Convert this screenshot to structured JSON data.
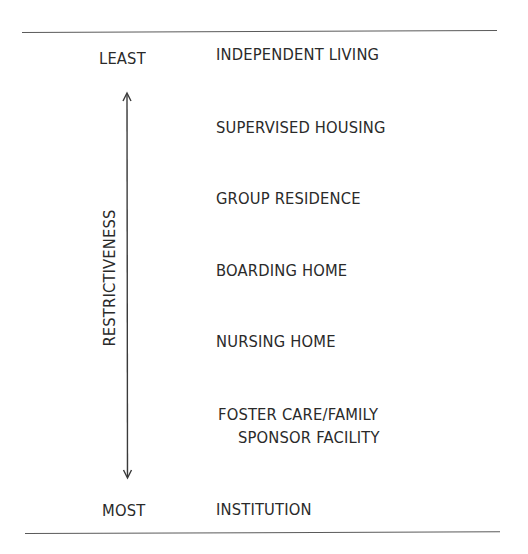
{
  "diagram": {
    "axis": {
      "label": "RESTRICTIVENESS",
      "top_label": "LEAST",
      "bottom_label": "MOST",
      "direction": "bidirectional"
    },
    "levels": [
      {
        "label": "INDEPENDENT LIVING"
      },
      {
        "label": "SUPERVISED HOUSING"
      },
      {
        "label": "GROUP RESIDENCE"
      },
      {
        "label": "BOARDING HOME"
      },
      {
        "label": "NURSING HOME"
      },
      {
        "label_line1": "FOSTER CARE/FAMILY",
        "label_line2": "SPONSOR FACILITY"
      },
      {
        "label": "INSTITUTION"
      }
    ],
    "colors": {
      "text": "#2a2a2a",
      "rule": "#5a5a5a",
      "background": "#ffffff"
    }
  }
}
